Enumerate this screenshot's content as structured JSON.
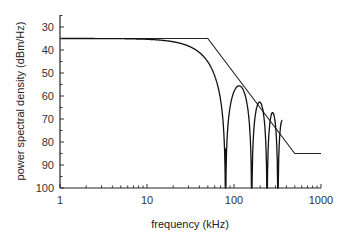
{
  "chart_data": {
    "type": "line",
    "title": "",
    "xlabel": "frequency (kHz)",
    "ylabel": "power spectral density (dBm/Hz)",
    "xscale": "log",
    "xlim": [
      1,
      1000
    ],
    "ylim": [
      100,
      25
    ],
    "y_inverted": true,
    "grid": false,
    "legend": "none",
    "x_ticks": [
      "1",
      "10",
      "100",
      "1000"
    ],
    "y_ticks": [
      "30",
      "40",
      "50",
      "60",
      "70",
      "80",
      "90",
      "100"
    ],
    "series": [
      {
        "name": "PSD mask",
        "x": [
          1,
          50,
          500,
          1000
        ],
        "y": [
          35,
          35,
          85,
          85
        ]
      },
      {
        "name": "signal PSD",
        "x": [
          1,
          10,
          20,
          30,
          40,
          50,
          60,
          70,
          75,
          79,
          80,
          83,
          90,
          100,
          110,
          130,
          145,
          157,
          160,
          165,
          180,
          200,
          220,
          235,
          240,
          245,
          260,
          280,
          300,
          315,
          320,
          330,
          345,
          360
        ],
        "y": [
          35,
          35,
          35.5,
          37,
          40,
          44,
          49,
          57,
          64,
          83,
          83,
          66,
          60,
          58,
          59,
          65,
          74,
          95,
          95,
          80,
          77,
          79,
          87,
          100,
          100,
          92,
          89,
          91,
          100,
          100,
          100,
          98.5,
          98.5,
          100
        ]
      }
    ],
    "annotations": {
      "nulls_khz": [
        80,
        160,
        240,
        320
      ]
    }
  }
}
